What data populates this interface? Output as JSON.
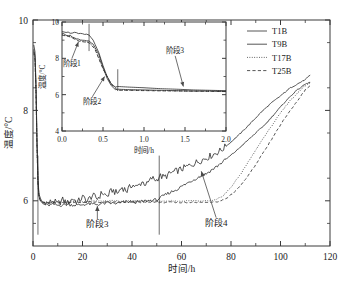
{
  "figure": {
    "background": "#ffffff",
    "line_color": "#2b2b2b"
  },
  "chart_data": {
    "type": "line",
    "title": "",
    "xlabel": "时间/h",
    "ylabel": "温度/°C",
    "xlim": [
      0,
      120
    ],
    "ylim": [
      5,
      10
    ],
    "xticks": [
      0,
      20,
      40,
      60,
      80,
      100,
      120
    ],
    "yticks": [
      6,
      8,
      10
    ],
    "xtick_labels": [
      "0",
      "20",
      "40",
      "60",
      "80",
      "100",
      "120"
    ],
    "ytick_labels": [
      "6",
      "8",
      "10"
    ],
    "grid": false,
    "legend_position": "top-right",
    "legend": [
      "T1B",
      "T9B",
      "T17B",
      "T25B"
    ],
    "series": [
      {
        "name": "T1B",
        "style": "solid",
        "x": [
          0.3,
          0.8,
          1.2,
          1.6,
          2.0,
          2.4,
          3.0,
          4.0,
          5.0,
          6.0,
          8.0,
          10.0,
          12.0,
          14.0,
          16.0,
          18.0,
          20.0,
          22.0,
          24.0,
          26.0,
          28.0,
          30.0,
          32.0,
          34.0,
          36.0,
          38.0,
          40.0,
          42.0,
          44.0,
          46.0,
          48.0,
          50.0,
          51.0,
          53.0,
          56.0,
          60.0,
          64.0,
          68.0,
          72.0,
          76.0,
          80.0,
          84.0,
          88.0,
          92.0,
          96.0,
          100.0,
          104.0,
          108.0,
          110.0,
          112.0
        ],
        "y": [
          9.45,
          9.3,
          8.6,
          7.4,
          6.5,
          6.15,
          6.02,
          5.96,
          5.99,
          5.94,
          6.0,
          5.93,
          6.02,
          5.95,
          6.05,
          5.97,
          6.08,
          6.0,
          6.12,
          6.05,
          6.18,
          6.1,
          6.24,
          6.16,
          6.3,
          6.22,
          6.36,
          6.3,
          6.42,
          6.36,
          6.5,
          6.46,
          6.55,
          6.52,
          6.62,
          6.7,
          6.8,
          6.9,
          7.0,
          7.12,
          7.3,
          7.5,
          7.72,
          7.95,
          8.15,
          8.32,
          8.5,
          8.62,
          8.68,
          8.78
        ]
      },
      {
        "name": "T9B",
        "style": "solid",
        "x": [
          0.3,
          0.8,
          1.2,
          1.6,
          2.0,
          2.4,
          3.0,
          4.0,
          6.0,
          8.0,
          10.0,
          14.0,
          18.0,
          22.0,
          26.0,
          30.0,
          34.0,
          38.0,
          42.0,
          46.0,
          50.0,
          51.0,
          54.0,
          58.0,
          62.0,
          66.0,
          70.0,
          74.0,
          78.0,
          82.0,
          86.0,
          90.0,
          94.0,
          98.0,
          102.0,
          106.0,
          110.0,
          112.0
        ],
        "y": [
          9.35,
          9.2,
          8.5,
          7.3,
          6.45,
          6.1,
          6.0,
          5.93,
          5.9,
          5.92,
          5.9,
          5.92,
          5.9,
          5.93,
          5.92,
          5.95,
          5.94,
          5.98,
          5.97,
          6.0,
          6.02,
          6.05,
          6.15,
          6.25,
          6.38,
          6.5,
          6.6,
          6.75,
          6.92,
          7.1,
          7.3,
          7.5,
          7.7,
          7.95,
          8.2,
          8.42,
          8.58,
          8.62
        ]
      },
      {
        "name": "T17B",
        "style": "dotted",
        "x": [
          0.3,
          0.8,
          1.2,
          1.6,
          2.0,
          2.4,
          3.0,
          5.0,
          8.0,
          12.0,
          16.0,
          20.0,
          24.0,
          28.0,
          32.0,
          36.0,
          40.0,
          44.0,
          48.0,
          52.0,
          56.0,
          60.0,
          64.0,
          68.0,
          72.0,
          74.0,
          77.0,
          80.0,
          84.0,
          88.0,
          92.0,
          96.0,
          100.0,
          104.0,
          108.0,
          110.0,
          112.0
        ],
        "y": [
          9.3,
          9.15,
          8.45,
          7.25,
          6.4,
          6.1,
          6.0,
          5.96,
          5.98,
          5.97,
          5.99,
          5.98,
          6.0,
          5.99,
          6.0,
          5.99,
          6.0,
          5.99,
          6.0,
          5.99,
          6.0,
          5.99,
          6.0,
          5.99,
          6.0,
          6.02,
          6.12,
          6.3,
          6.6,
          6.95,
          7.3,
          7.62,
          7.95,
          8.22,
          8.45,
          8.55,
          8.6
        ]
      },
      {
        "name": "T25B",
        "style": "dashed",
        "x": [
          0.3,
          0.8,
          1.2,
          1.6,
          2.0,
          2.4,
          3.0,
          5.0,
          8.0,
          12.0,
          16.0,
          20.0,
          24.0,
          28.0,
          32.0,
          36.0,
          40.0,
          44.0,
          48.0,
          52.0,
          56.0,
          60.0,
          64.0,
          68.0,
          72.0,
          75.0,
          78.0,
          82.0,
          86.0,
          90.0,
          94.0,
          98.0,
          102.0,
          106.0,
          110.0,
          112.0
        ],
        "y": [
          9.28,
          9.12,
          8.42,
          7.22,
          6.38,
          6.08,
          5.99,
          5.95,
          5.96,
          5.95,
          5.97,
          5.96,
          5.98,
          5.96,
          5.98,
          5.96,
          5.98,
          5.96,
          5.98,
          5.96,
          5.97,
          5.96,
          5.97,
          5.96,
          5.97,
          5.98,
          6.05,
          6.22,
          6.48,
          6.8,
          7.15,
          7.5,
          7.85,
          8.15,
          8.45,
          8.55
        ]
      }
    ],
    "annotations": [
      {
        "label": "阶段3",
        "x": 26,
        "y": 5.42,
        "arrow_to_x": 26,
        "arrow_to_y": 5.95
      },
      {
        "label": "阶段4",
        "x": 74,
        "y": 5.45,
        "arrow_to_x": 68,
        "arrow_to_y": 6.72
      }
    ],
    "vertical_markers": [
      2.0,
      51.0
    ],
    "inset": {
      "type": "line",
      "xlabel": "时间/h",
      "ylabel": "温度/°C",
      "xlim": [
        0,
        2
      ],
      "ylim": [
        4,
        10
      ],
      "xticks": [
        0.0,
        0.5,
        1.0,
        1.5,
        2.0
      ],
      "yticks": [
        4,
        6,
        8,
        10
      ],
      "xtick_labels": [
        "0.0",
        "0.5",
        "1.0",
        "1.5",
        "2.0"
      ],
      "ytick_labels": [
        "4",
        "6",
        "8",
        "10"
      ],
      "grid": false,
      "series": [
        {
          "name": "T1B",
          "style": "solid",
          "x": [
            0.0,
            0.05,
            0.1,
            0.15,
            0.2,
            0.25,
            0.3,
            0.33,
            0.38,
            0.45,
            0.5,
            0.55,
            0.6,
            0.65,
            0.68,
            0.8,
            1.0,
            1.2,
            1.4,
            1.6,
            1.8,
            2.0
          ],
          "y": [
            9.5,
            9.45,
            9.4,
            9.42,
            9.35,
            9.33,
            9.3,
            9.28,
            9.0,
            8.3,
            7.6,
            7.0,
            6.6,
            6.42,
            6.45,
            6.42,
            6.38,
            6.33,
            6.3,
            6.26,
            6.24,
            6.22
          ]
        },
        {
          "name": "T9B",
          "style": "solid",
          "x": [
            0.0,
            0.05,
            0.1,
            0.15,
            0.2,
            0.25,
            0.3,
            0.33,
            0.38,
            0.45,
            0.5,
            0.55,
            0.6,
            0.65,
            0.68,
            0.8,
            1.0,
            1.2,
            1.4,
            1.6,
            1.8,
            2.0
          ],
          "y": [
            9.35,
            9.3,
            9.25,
            9.15,
            9.05,
            8.98,
            8.95,
            8.93,
            8.78,
            8.2,
            7.5,
            6.9,
            6.5,
            6.28,
            6.3,
            6.28,
            6.26,
            6.24,
            6.22,
            6.2,
            6.2,
            6.18
          ]
        },
        {
          "name": "T17B",
          "style": "dotted",
          "x": [
            0.0,
            0.1,
            0.2,
            0.3,
            0.33,
            0.4,
            0.5,
            0.6,
            0.68,
            0.9,
            1.2,
            1.5,
            1.8,
            2.0
          ],
          "y": [
            9.3,
            9.2,
            8.98,
            8.9,
            8.88,
            8.55,
            7.45,
            6.6,
            6.25,
            6.24,
            6.22,
            6.2,
            6.19,
            6.18
          ]
        },
        {
          "name": "T25B",
          "style": "dashed",
          "x": [
            0.0,
            0.1,
            0.2,
            0.3,
            0.33,
            0.4,
            0.5,
            0.6,
            0.68,
            0.9,
            1.2,
            1.5,
            1.8,
            2.0
          ],
          "y": [
            9.28,
            9.18,
            8.95,
            8.88,
            8.86,
            8.52,
            7.42,
            6.58,
            6.24,
            6.23,
            6.21,
            6.2,
            6.18,
            6.17
          ]
        }
      ],
      "annotations": [
        {
          "label": "阶段1",
          "x": 0.12,
          "y": 7.6,
          "arrow_to_x": 0.2,
          "arrow_to_y": 8.9
        },
        {
          "label": "阶段2",
          "x": 0.37,
          "y": 5.5,
          "arrow_to_x": 0.52,
          "arrow_to_y": 7.0
        },
        {
          "label": "阶段3",
          "x": 1.38,
          "y": 8.3,
          "arrow_to_x": 1.48,
          "arrow_to_y": 6.45
        }
      ],
      "vertical_markers": [
        0.33,
        0.68
      ]
    }
  }
}
